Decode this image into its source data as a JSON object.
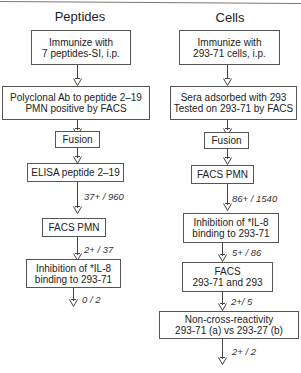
{
  "columns": [
    {
      "title": "Peptides",
      "steps": [
        {
          "lines": [
            "Immunize with",
            "7 peptides-SI, i.p."
          ]
        },
        {
          "lines": [
            "Polyclonal Ab to peptide 2–19",
            "PMN positive by FACS"
          ]
        },
        {
          "lines": [
            "Fusion"
          ]
        },
        {
          "lines": [
            "ELISA  peptide 2–19"
          ]
        },
        {
          "lines": [
            "FACS   PMN"
          ]
        },
        {
          "lines": [
            "Inhibition of *IL-8",
            "binding to 293-71"
          ]
        }
      ],
      "arrow_labels": [
        "37+ / 960",
        "2+ / 37",
        "0 /  2"
      ]
    },
    {
      "title": "Cells",
      "steps": [
        {
          "lines": [
            "Immunize with",
            "293-71 cells, i.p."
          ]
        },
        {
          "lines": [
            "Sera adsorbed with 293",
            "Tested on 293-71 by  FACS"
          ]
        },
        {
          "lines": [
            "Fusion"
          ]
        },
        {
          "lines": [
            "FACS  PMN"
          ]
        },
        {
          "lines": [
            "Inhibition of *IL-8",
            "binding to 293-71"
          ]
        },
        {
          "lines": [
            "FACS",
            "293-71 and 293"
          ]
        },
        {
          "lines": [
            "Non-cross-reactivity",
            "293-71 (a) vs 293-27 (b)"
          ]
        }
      ],
      "arrow_labels": [
        "86+ / 1540",
        "5+ / 86",
        "2+/ 5",
        "2+ / 2"
      ]
    }
  ]
}
